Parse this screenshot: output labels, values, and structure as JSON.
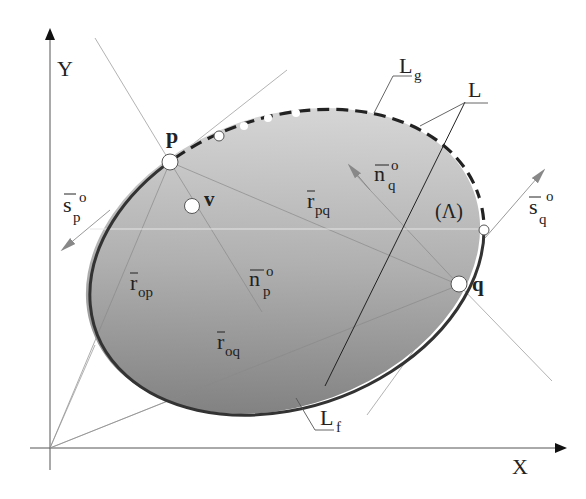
{
  "diagram": {
    "axes": {
      "x_label": "X",
      "y_label": "Y"
    },
    "points": {
      "p": "p",
      "q": "q",
      "v": "v"
    },
    "vectors": {
      "s_p": {
        "base": "s",
        "sub": "p",
        "sup": "o"
      },
      "s_q": {
        "base": "s",
        "sub": "q",
        "sup": "o"
      },
      "n_p": {
        "base": "n",
        "sub": "p",
        "sup": "o"
      },
      "n_q": {
        "base": "n",
        "sub": "q",
        "sup": "o"
      },
      "r_pq": {
        "base": "r",
        "sub": "pq"
      },
      "r_op": {
        "base": "r",
        "sub": "op"
      },
      "r_oq": {
        "base": "r",
        "sub": "oq"
      }
    },
    "region_label": "(Λ)",
    "curves": {
      "L": "L",
      "Lg": {
        "base": "L",
        "sub": "g"
      },
      "Lf": {
        "base": "L",
        "sub": "f"
      }
    },
    "colors": {
      "region_fill_light": "#d6d6d6",
      "region_fill_dark": "#7a7a7a",
      "boundary": "#333333",
      "thin_lines": "#9a9a9a",
      "arrow_gray": "#888888"
    }
  }
}
